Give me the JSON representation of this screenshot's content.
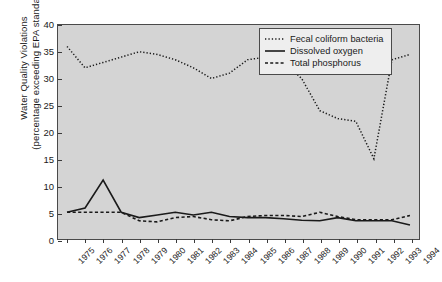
{
  "chart_data": {
    "type": "line",
    "title": "",
    "xlabel": "",
    "ylabel": "Water Quality Violations (percentage exceeding EPA standard)",
    "ylabel_line1": "Water Quality Violations",
    "ylabel_line2": "(percentage exceeding EPA standard)",
    "ylim": [
      0,
      40
    ],
    "yticks": [
      0,
      5,
      10,
      15,
      20,
      25,
      30,
      35,
      40
    ],
    "grid": false,
    "legend_position": "top-right",
    "categories": [
      "1975",
      "1976",
      "1977",
      "1978",
      "1979",
      "1980",
      "1981",
      "1982",
      "1983",
      "1984",
      "1985",
      "1986",
      "1987",
      "1988",
      "1989",
      "1990",
      "1991",
      "1992",
      "1993",
      "1994"
    ],
    "series": [
      {
        "name": "Fecal coliform bacteria",
        "style": "dotted",
        "color": "#1a1a1a",
        "values": [
          36,
          32,
          33,
          34,
          35,
          34.5,
          33.5,
          32,
          30,
          31,
          33.5,
          34,
          33,
          30,
          24,
          22.5,
          22,
          27,
          33.5,
          34.5
        ]
      },
      {
        "name": "Dissolved oxygen",
        "style": "solid",
        "color": "#1a1a1a",
        "values": [
          5,
          5.8,
          11,
          5,
          4,
          4.5,
          5,
          4.5,
          5,
          4.2,
          4,
          4,
          3.8,
          3.5,
          3.4,
          4,
          3.4,
          3.4,
          3.4,
          2.6
        ]
      },
      {
        "name": "Total phosphorus",
        "style": "dashed",
        "color": "#1a1a1a",
        "values": [
          5,
          5,
          5,
          5,
          3.4,
          3.2,
          4,
          4.2,
          3.6,
          3.4,
          4.2,
          4.4,
          4.4,
          4.2,
          5,
          4.2,
          3.6,
          3.6,
          3.6,
          4.4
        ]
      }
    ],
    "extra_series_notes": {
      "fecal_dip_year": "1992",
      "fecal_dip_value": 15
    }
  },
  "legend": {
    "items": [
      {
        "label": "Fecal coliform bacteria",
        "key": "dotted-line-key"
      },
      {
        "label": "Dissolved oxygen",
        "key": "solid-line-key"
      },
      {
        "label": "Total phosphorus",
        "key": "dashed-line-key"
      }
    ]
  },
  "colors": {
    "plot_background": "#d4d4d4",
    "page_background": "#ffffff",
    "axis": "#4a4a4a",
    "line": "#1a1a1a",
    "legend_background": "#eeeeee"
  }
}
